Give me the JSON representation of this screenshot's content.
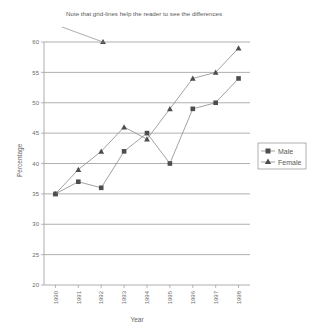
{
  "chart_data": {
    "type": "line",
    "title": "",
    "annotation": "Note that grid-lines help the reader to see the differences",
    "xlabel": "Year",
    "ylabel": "Percentage",
    "categories": [
      "1990",
      "1991",
      "1992",
      "1993",
      "1994",
      "1995",
      "1996",
      "1997",
      "1998"
    ],
    "ylim": [
      20,
      60
    ],
    "yticks": [
      "20",
      "25",
      "30",
      "35",
      "40",
      "45",
      "50",
      "55",
      "60"
    ],
    "grid": true,
    "legend_position": "right",
    "series": [
      {
        "name": "Male",
        "marker": "square",
        "values": [
          35,
          37,
          36,
          42,
          45,
          40,
          49,
          50,
          54
        ]
      },
      {
        "name": "Female",
        "marker": "triangle",
        "values": [
          35,
          39,
          42,
          46,
          44,
          49,
          54,
          55,
          59
        ]
      }
    ]
  },
  "legend": {
    "items": [
      {
        "label": "Male"
      },
      {
        "label": "Female"
      }
    ]
  },
  "colors": {
    "marker": "#4d4d4d",
    "line": "#8a8a8a",
    "grid": "#8e8e8e",
    "text": "#5a5a5a",
    "background": "#ffffff"
  }
}
